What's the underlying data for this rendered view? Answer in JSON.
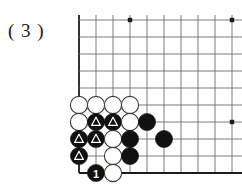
{
  "figure": {
    "label": "( 3 )",
    "caption": ""
  },
  "board": {
    "type": "go-board-corner",
    "origin_x": 79,
    "origin_y": 20,
    "spacing": 17,
    "cols": 10,
    "rows": 10,
    "line_color": "#6e6e6e",
    "edge_color": "#1c1c1c",
    "background": "#ffffff",
    "left_edge_is_board_edge": true,
    "bottom_edge_is_board_edge": true,
    "top_edge_is_board_edge": false,
    "right_edge_is_board_edge": false,
    "star_points": [
      {
        "col": 3,
        "row": 0
      },
      {
        "col": 9,
        "row": 0
      },
      {
        "col": 9,
        "row": 6
      }
    ],
    "stone_radius": 8.6,
    "black_color": "#111111",
    "white_color": "#ffffff",
    "white_outline": "#3a3a3a",
    "marker_color": "#ffffff"
  },
  "stones": [
    {
      "col": 0,
      "row": 5,
      "color": "white",
      "marker": "none",
      "label": ""
    },
    {
      "col": 1,
      "row": 5,
      "color": "white",
      "marker": "none",
      "label": ""
    },
    {
      "col": 2,
      "row": 5,
      "color": "white",
      "marker": "none",
      "label": ""
    },
    {
      "col": 3,
      "row": 5,
      "color": "white",
      "marker": "none",
      "label": ""
    },
    {
      "col": 0,
      "row": 6,
      "color": "white",
      "marker": "none",
      "label": ""
    },
    {
      "col": 1,
      "row": 6,
      "color": "black",
      "marker": "triangle",
      "label": ""
    },
    {
      "col": 2,
      "row": 6,
      "color": "black",
      "marker": "triangle",
      "label": ""
    },
    {
      "col": 3,
      "row": 6,
      "color": "white",
      "marker": "none",
      "label": ""
    },
    {
      "col": 4,
      "row": 6,
      "color": "black",
      "marker": "none",
      "label": ""
    },
    {
      "col": 0,
      "row": 7,
      "color": "black",
      "marker": "triangle",
      "label": ""
    },
    {
      "col": 1,
      "row": 7,
      "color": "black",
      "marker": "triangle",
      "label": ""
    },
    {
      "col": 2,
      "row": 7,
      "color": "white",
      "marker": "none",
      "label": ""
    },
    {
      "col": 3,
      "row": 7,
      "color": "black",
      "marker": "none",
      "label": ""
    },
    {
      "col": 5,
      "row": 7,
      "color": "black",
      "marker": "none",
      "label": ""
    },
    {
      "col": 0,
      "row": 8,
      "color": "black",
      "marker": "triangle",
      "label": ""
    },
    {
      "col": 2,
      "row": 8,
      "color": "white",
      "marker": "none",
      "label": ""
    },
    {
      "col": 3,
      "row": 8,
      "color": "black",
      "marker": "none",
      "label": ""
    },
    {
      "col": 1,
      "row": 9,
      "color": "black",
      "marker": "none",
      "label": "1"
    },
    {
      "col": 2,
      "row": 9,
      "color": "white",
      "marker": "none",
      "label": ""
    }
  ]
}
